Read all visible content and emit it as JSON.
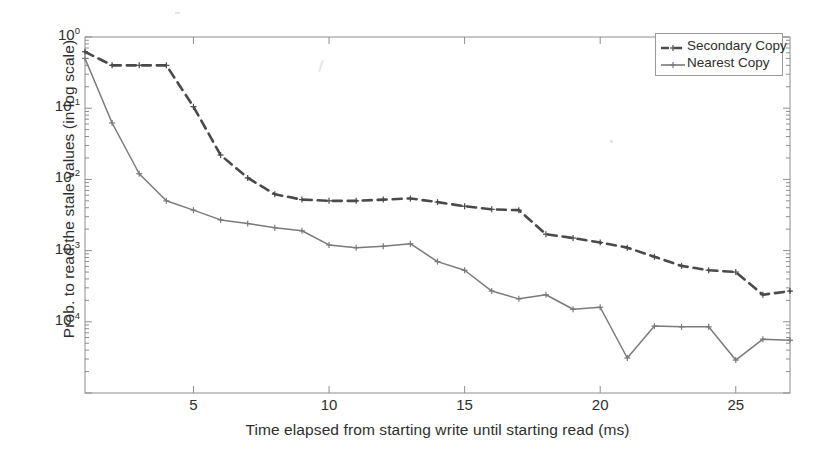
{
  "chart_data": {
    "type": "line",
    "title": "",
    "xlabel": "Time elapsed from starting write until starting read (ms)",
    "ylabel": "Prob. to read the stale values (in log scale)",
    "yscale": "log",
    "xlim": [
      1,
      27
    ],
    "ylim": [
      2e-05,
      1.0
    ],
    "xticks": [
      5,
      10,
      15,
      20,
      25
    ],
    "xtick_labels": [
      "5",
      "10",
      "15",
      "20",
      "25"
    ],
    "yticks": [
      1,
      0.1,
      0.01,
      0.001,
      0.0001
    ],
    "ytick_labels": [
      "10^0",
      "10^-1",
      "10^-2",
      "10^-3",
      "10^-4"
    ],
    "grid": false,
    "legend_position": "top-right",
    "x": [
      1,
      2,
      3,
      4,
      5,
      6,
      7,
      8,
      9,
      10,
      11,
      12,
      13,
      14,
      15,
      16,
      17,
      18,
      19,
      20,
      21,
      22,
      23,
      24,
      25,
      26,
      27
    ],
    "series": [
      {
        "name": "Secondary Copy",
        "style": "dashed",
        "color": "#4a4a4a",
        "values": [
          0.62,
          0.4,
          0.4,
          0.4,
          0.105,
          0.022,
          0.0105,
          0.0062,
          0.0052,
          0.005,
          0.005,
          0.0052,
          0.0054,
          0.0048,
          0.0042,
          0.0038,
          0.0037,
          0.0017,
          0.0015,
          0.0013,
          0.0011,
          0.00082,
          0.00061,
          0.00053,
          0.0005,
          0.00024,
          0.00027
        ]
      },
      {
        "name": "Nearest Copy",
        "style": "solid",
        "color": "#7a7a7a",
        "values": [
          0.5,
          0.062,
          0.012,
          0.005,
          0.0037,
          0.0027,
          0.0024,
          0.0021,
          0.0019,
          0.0012,
          0.0011,
          0.00115,
          0.00125,
          0.0007,
          0.00053,
          0.00027,
          0.00021,
          0.00024,
          0.00015,
          0.00016,
          3.1e-05,
          8.7e-05,
          8.5e-05,
          8.5e-05,
          2.9e-05,
          5.7e-05,
          5.5e-05
        ]
      }
    ]
  },
  "legend": {
    "entries": [
      {
        "label": "Secondary Copy"
      },
      {
        "label": "Nearest Copy"
      }
    ]
  }
}
